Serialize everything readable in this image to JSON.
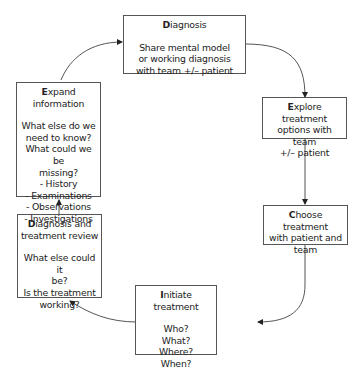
{
  "diagram": {
    "nodes": [
      {
        "id": "diagnosis",
        "cap": "D",
        "rest": "iagnosis",
        "body": [
          "Share mental model",
          "or working diagnosis",
          "with team +/– patient"
        ]
      },
      {
        "id": "explore",
        "cap": "E",
        "rest": "xplore treatment",
        "body": [
          "options with team",
          "+/– patient"
        ]
      },
      {
        "id": "choose",
        "cap": "C",
        "rest": "hoose treatment",
        "body": [
          "with patient and",
          "team"
        ]
      },
      {
        "id": "initiate",
        "cap": "I",
        "rest": "nitiate treatment",
        "body": [
          "Who?",
          "What?",
          "Where?",
          "When?"
        ]
      },
      {
        "id": "review",
        "cap": "D",
        "rest": "iagnosis and",
        "body": [
          "treatment review",
          "",
          "What else could it",
          "be?",
          "Is the treatment",
          "working?"
        ]
      },
      {
        "id": "expand",
        "cap": "E",
        "rest": "xpand information",
        "body": [
          "What else do we",
          "need to know?",
          "What could we be",
          "missing?",
          "- History",
          "- Examinations",
          "- Observations",
          "- Investigations"
        ]
      }
    ],
    "edges": [
      {
        "from": "diagnosis",
        "to": "explore"
      },
      {
        "from": "explore",
        "to": "choose"
      },
      {
        "from": "choose",
        "to": "initiate"
      },
      {
        "from": "initiate",
        "to": "review"
      },
      {
        "from": "review",
        "to": "expand"
      },
      {
        "from": "expand",
        "to": "diagnosis"
      }
    ]
  }
}
